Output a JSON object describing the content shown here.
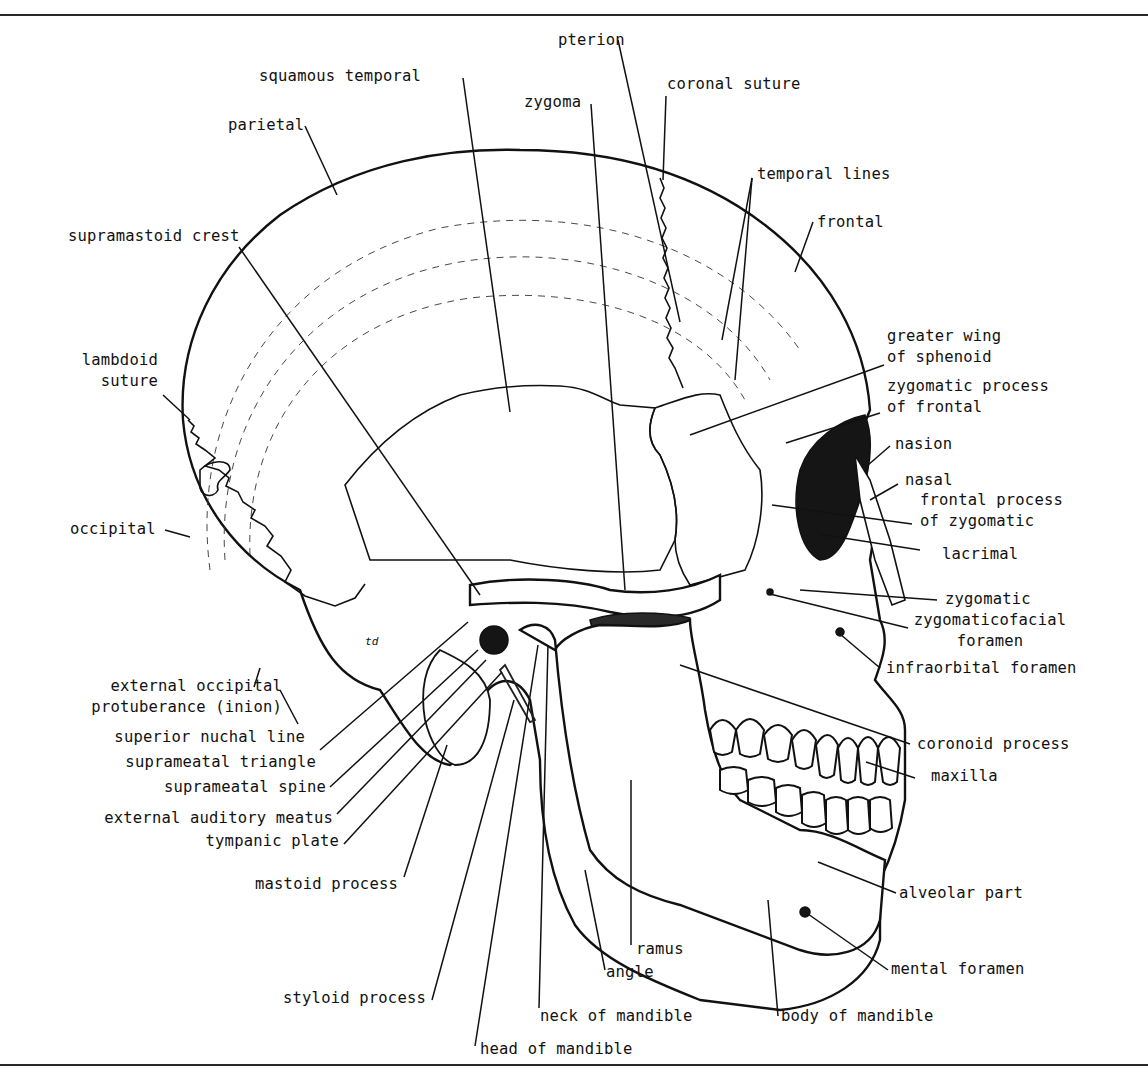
{
  "figure": {
    "colors": {
      "ink": "#111111",
      "paper": "#ffffff",
      "rule": "#2a2a2a"
    }
  },
  "labels": {
    "pterion": "pterion",
    "coronal_suture": "coronal suture",
    "squamous_temporal": "squamous temporal",
    "zygoma": "zygoma",
    "parietal": "parietal",
    "temporal_lines": "temporal lines",
    "supramastoid_crest": "supramastoid crest",
    "frontal": "frontal",
    "greater_wing_of_sphenoid": "greater wing\nof sphenoid",
    "lambdoid_suture": "lambdoid\nsuture",
    "zygomatic_process_of_frontal": "zygomatic process\nof frontal",
    "nasion": "nasion",
    "nasal": "nasal",
    "frontal_process_of_zygomatic": "frontal process\nof zygomatic",
    "occipital": "occipital",
    "lacrimal": "lacrimal",
    "zygomatic": "zygomatic",
    "zygomaticofacial_foramen": "zygomaticofacial\nforamen",
    "infraorbital_foramen": "infraorbital foramen",
    "external_occipital_protuberance": "external occipital\nprotuberance (inion)",
    "superior_nuchal_line": "superior nuchal line",
    "suprameatal_triangle": "suprameatal triangle",
    "suprameatal_spine": "suprameatal spine",
    "external_auditory_meatus": "external auditory meatus",
    "tympanic_plate": "tympanic plate",
    "coronoid_process": "coronoid process",
    "maxilla": "maxilla",
    "mastoid_process": "mastoid process",
    "alveolar_part": "alveolar part",
    "ramus": "ramus",
    "angle": "angle",
    "mental_foramen": "mental foramen",
    "styloid_process": "styloid process",
    "neck_of_mandible": "neck of mandible",
    "body_of_mandible": "body of mandible",
    "head_of_mandible": "head of mandible",
    "inline_mark": "td"
  }
}
